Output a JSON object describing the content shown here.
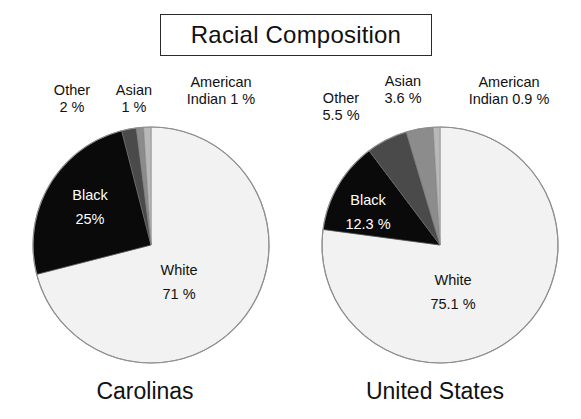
{
  "title": "Racial Composition",
  "chart_data": [
    {
      "type": "pie",
      "title": "Carolinas",
      "categories": [
        "White",
        "Black",
        "Other",
        "Asian",
        "American Indian"
      ],
      "values": [
        71,
        25,
        2,
        1,
        1
      ],
      "labels": [
        "White",
        "Black",
        "Other",
        "Asian",
        "American Indian"
      ],
      "value_labels": [
        "71 %",
        "25%",
        "2 %",
        "1 %",
        "1 %"
      ],
      "colors": [
        "#f2f2f2",
        "#0a0a0a",
        "#4a4a4a",
        "#8c8c8c",
        "#b8b8b8"
      ],
      "legend": "none",
      "start_angle_deg": 0,
      "direction": "clockwise"
    },
    {
      "type": "pie",
      "title": "United States",
      "categories": [
        "White",
        "Black",
        "Other",
        "Asian",
        "American Indian"
      ],
      "values": [
        75.1,
        12.3,
        5.5,
        3.6,
        0.9
      ],
      "labels": [
        "White",
        "Black",
        "Other",
        "Asian",
        "American Indian"
      ],
      "value_labels": [
        "75.1 %",
        "12.3 %",
        "5.5 %",
        "3.6 %",
        "0.9 %"
      ],
      "colors": [
        "#f2f2f2",
        "#0a0a0a",
        "#4a4a4a",
        "#8c8c8c",
        "#b8b8b8"
      ],
      "legend": "none",
      "start_angle_deg": 0,
      "direction": "clockwise"
    }
  ],
  "left": {
    "caption": "Carolinas",
    "callouts": {
      "other": {
        "name": "Other",
        "value": "2 %"
      },
      "asian": {
        "name": "Asian",
        "value": "1 %"
      },
      "american_indian": {
        "name": "American",
        "value": "Indian 1 %"
      }
    },
    "slices": {
      "black": {
        "name": "Black",
        "value": "25%"
      },
      "white": {
        "name": "White",
        "value": "71 %"
      }
    }
  },
  "right": {
    "caption": "United States",
    "callouts": {
      "other": {
        "name": "Other",
        "value": "5.5 %"
      },
      "asian": {
        "name": "Asian",
        "value": "3.6 %"
      },
      "american_indian": {
        "name": "American",
        "value": "Indian 0.9 %"
      }
    },
    "slices": {
      "black": {
        "name": "Black",
        "value": "12.3 %"
      },
      "white": {
        "name": "White",
        "value": "75.1 %"
      }
    }
  }
}
